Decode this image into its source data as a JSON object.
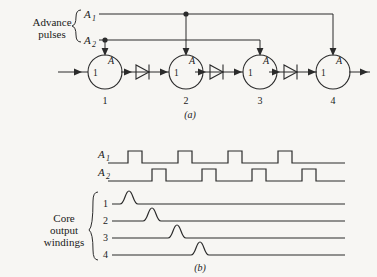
{
  "figure": {
    "background_color": "#f7f6f3",
    "line_color": "#2b2b2b",
    "panel_a": {
      "caption": "(a)",
      "advance_label_line1": "Advance",
      "advance_label_line2": "pulses",
      "input_labels": [
        {
          "base": "A",
          "sub": "1"
        },
        {
          "base": "A",
          "sub": "2"
        }
      ],
      "cores": [
        {
          "index_label": "1",
          "inner_left": "1",
          "inner_right": "A",
          "driven_by": "A2"
        },
        {
          "index_label": "2",
          "inner_left": "1",
          "inner_right": "A",
          "driven_by": "A1"
        },
        {
          "index_label": "3",
          "inner_left": "1",
          "inner_right": "A",
          "driven_by": "A2"
        },
        {
          "index_label": "4",
          "inner_left": "1",
          "inner_right": "A",
          "driven_by": "A1"
        }
      ],
      "diode_count": 3
    },
    "panel_b": {
      "caption": "(b)",
      "core_group_label_line1": "Core",
      "core_group_label_line2": "output",
      "core_group_label_line3": "windings",
      "waveform_labels": [
        {
          "base": "A",
          "sub": "1"
        },
        {
          "base": "A",
          "sub": "2"
        }
      ],
      "winding_labels": [
        "1",
        "2",
        "3",
        "4"
      ]
    }
  },
  "chart_data": {
    "type": "line",
    "title": "",
    "xlabel": "",
    "ylabel": "",
    "series": [
      {
        "name": "A1",
        "kind": "pulse-train",
        "baseline_y": 163,
        "pulse_height": 12,
        "x_start": 108,
        "x_end": 345,
        "pulses": [
          {
            "rise": 128,
            "fall": 142
          },
          {
            "rise": 178,
            "fall": 192
          },
          {
            "rise": 228,
            "fall": 242
          },
          {
            "rise": 278,
            "fall": 292
          }
        ]
      },
      {
        "name": "A2",
        "kind": "pulse-train",
        "baseline_y": 181,
        "pulse_height": 12,
        "x_start": 108,
        "x_end": 345,
        "pulses": [
          {
            "rise": 152,
            "fall": 166
          },
          {
            "rise": 202,
            "fall": 216
          },
          {
            "rise": 252,
            "fall": 266
          },
          {
            "rise": 302,
            "fall": 316
          }
        ]
      },
      {
        "name": "winding-1",
        "kind": "single-bump",
        "baseline_y": 204,
        "x_start": 112,
        "x_end": 345,
        "peak_x": 129,
        "peak_height": 13,
        "half_width": 9
      },
      {
        "name": "winding-2",
        "kind": "single-bump",
        "baseline_y": 221,
        "x_start": 112,
        "x_end": 345,
        "peak_x": 152,
        "peak_height": 13,
        "half_width": 9
      },
      {
        "name": "winding-3",
        "kind": "single-bump",
        "baseline_y": 238,
        "x_start": 112,
        "x_end": 345,
        "peak_x": 177,
        "peak_height": 13,
        "half_width": 9
      },
      {
        "name": "winding-4",
        "kind": "single-bump",
        "baseline_y": 255,
        "x_start": 112,
        "x_end": 345,
        "peak_x": 200,
        "peak_height": 13,
        "half_width": 9
      }
    ]
  }
}
